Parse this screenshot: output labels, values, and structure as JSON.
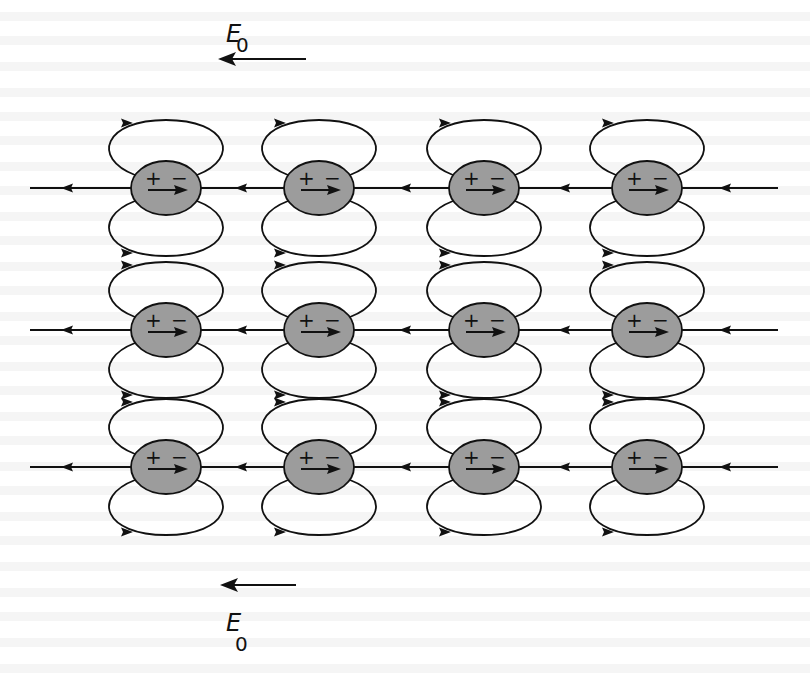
{
  "figure": {
    "field_top": {
      "symbol": "E",
      "subscript": "0",
      "direction": "left"
    },
    "field_bottom": {
      "symbol": "E",
      "subscript": "0",
      "direction": "left"
    },
    "grid": {
      "rows": 3,
      "columns": 4
    },
    "dipole": {
      "positive_label": "+",
      "negative_label": "−",
      "moment_direction": "right",
      "fill_color": "#9c9c9c"
    },
    "axis_line_arrow_direction": "left",
    "loop_arrow_direction": "right",
    "line_color": "#111111",
    "background_text_color": "#e9e9e9"
  }
}
